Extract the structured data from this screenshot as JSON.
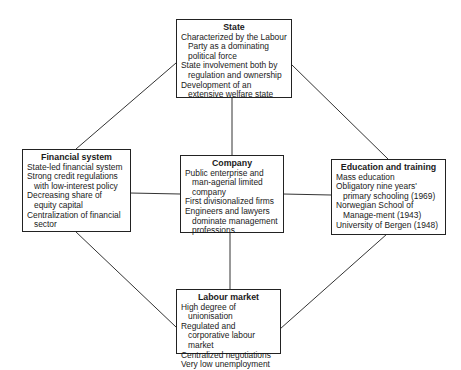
{
  "diagram": {
    "state": {
      "title": "State",
      "items": [
        "Characterized by the Labour Party as a dominating political force",
        "State involvement both by regulation and ownership",
        "Development of an extensive welfare state"
      ]
    },
    "financial": {
      "title": "Financial system",
      "items": [
        "State-led financial system",
        "Strong credit regulations with low-interest policy",
        "Decreasing share of equity capital",
        "Centralization of financial sector"
      ]
    },
    "company": {
      "title": "Company",
      "items": [
        "Public enterprise and man-agerial limited company",
        "First divisionalized firms",
        "Engineers and lawyers dominate management professions"
      ]
    },
    "education": {
      "title": "Education and training",
      "items": [
        "Mass education",
        "Obligatory nine years' primary schooling (1969)",
        "Norwegian School of Manage-ment (1943)",
        "University of Bergen (1948)"
      ]
    },
    "labour": {
      "title": "Labour market",
      "items": [
        "High degree of unionisation",
        "Regulated and corporative labour market",
        "Centralized negotiations",
        "Very low unemployment"
      ]
    },
    "connections": [
      [
        "state",
        "company"
      ],
      [
        "state",
        "financial"
      ],
      [
        "state",
        "education"
      ],
      [
        "financial",
        "company"
      ],
      [
        "company",
        "education"
      ],
      [
        "company",
        "labour"
      ],
      [
        "financial",
        "labour"
      ],
      [
        "education",
        "labour"
      ]
    ],
    "colors": {
      "line": "#333333",
      "border": "#222222",
      "text": "#1a1a1a",
      "background": "#ffffff"
    }
  }
}
